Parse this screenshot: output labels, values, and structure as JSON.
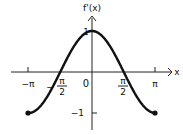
{
  "chart_data": {
    "type": "line",
    "title": "",
    "xlabel": "x",
    "ylabel": "f'(x)",
    "function": "cos(x)",
    "xlim": [
      -3.14159,
      3.14159
    ],
    "ylim": [
      -1,
      1
    ],
    "grid": false,
    "legend": null,
    "x_ticks": [
      {
        "value": -3.14159,
        "label": "−π"
      },
      {
        "value": -1.5708,
        "label": "π/2",
        "sign": "−"
      },
      {
        "value": 0,
        "label": "0"
      },
      {
        "value": 1.5708,
        "label": "π/2"
      },
      {
        "value": 3.14159,
        "label": "π"
      }
    ],
    "y_ticks": [
      {
        "value": 1,
        "label": "1"
      },
      {
        "value": -1,
        "label": "−1"
      }
    ],
    "series": [
      {
        "name": "f'(x)",
        "x": [
          -3.14159,
          -2.3562,
          -1.5708,
          -0.7854,
          0,
          0.7854,
          1.5708,
          2.3562,
          3.14159
        ],
        "values": [
          -1,
          -0.707,
          0,
          0.707,
          1,
          0.707,
          0,
          -0.707,
          -1
        ],
        "endpoints": "filled-dots",
        "color": "#111111"
      }
    ]
  },
  "labels": {
    "y_axis": "f'(x)",
    "x_axis": "x",
    "origin": "0",
    "neg_pi": "−π",
    "pos_pi": "π",
    "pi": "π",
    "two": "2",
    "minus": "−",
    "one": "1",
    "neg_one": "−1"
  }
}
